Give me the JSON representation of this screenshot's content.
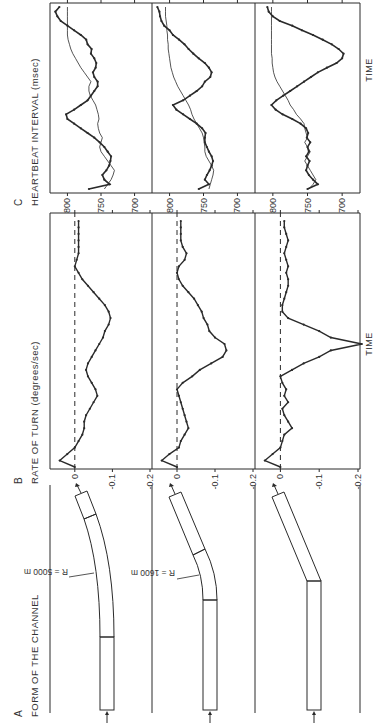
{
  "figure": {
    "orientation": "rotated 90deg counter-clockwise",
    "panels": {
      "A": {
        "letter": "A",
        "title": "FORM OF THE CHANNEL"
      },
      "B": {
        "letter": "B",
        "title": "RATE OF TURN (degrees/sec)"
      },
      "C": {
        "letter": "C",
        "title": "HEARTBEAT INTERVAL (msec)"
      }
    },
    "time_label": "TIME",
    "colors": {
      "ink": "#2a2a2a",
      "background": "#ffffff"
    }
  },
  "channel_forms": [
    {
      "row": 1,
      "label": "R = 5000 m",
      "type": "gentle curve"
    },
    {
      "row": 2,
      "label": "R = 1600 m",
      "type": "sharp curve"
    },
    {
      "row": 3,
      "label": "",
      "type": "abrupt bend"
    }
  ],
  "chart_data": [
    {
      "type": "line",
      "title": "RATE OF TURN (degrees/sec)",
      "xlabel": "TIME",
      "ylabel": "degrees/sec",
      "yticks": [
        "0",
        "-0.1",
        "-0.2"
      ],
      "ylim": [
        0.05,
        -0.2
      ],
      "reference_line": {
        "y": 0,
        "style": "dashed"
      },
      "rows": [
        {
          "row": 1,
          "channel": "R = 5000 m",
          "values": [
            0,
            0.04,
            0.02,
            0,
            -0.01,
            -0.02,
            -0.025,
            -0.025,
            -0.03,
            -0.04,
            -0.05,
            -0.06,
            -0.055,
            -0.045,
            -0.035,
            -0.03,
            -0.035,
            -0.045,
            -0.055,
            -0.065,
            -0.075,
            -0.08,
            -0.09,
            -0.095,
            -0.09,
            -0.08,
            -0.065,
            -0.05,
            -0.035,
            -0.02,
            -0.01,
            0,
            -0.005,
            -0.01,
            -0.01,
            -0.01,
            -0.01,
            -0.01,
            -0.01
          ]
        },
        {
          "row": 2,
          "channel": "R = 1600 m",
          "values": [
            0,
            0.04,
            0.02,
            -0.005,
            -0.01,
            -0.02,
            -0.03,
            -0.025,
            -0.02,
            -0.015,
            -0.01,
            -0.005,
            0,
            -0.015,
            -0.04,
            -0.06,
            -0.09,
            -0.12,
            -0.13,
            -0.125,
            -0.1,
            -0.085,
            -0.08,
            -0.07,
            -0.065,
            -0.055,
            -0.045,
            -0.03,
            -0.015,
            -0.005,
            0,
            -0.005,
            -0.02,
            -0.025,
            -0.015,
            -0.01,
            -0.01,
            -0.01,
            -0.01
          ]
        },
        {
          "row": 3,
          "channel": "abrupt bend",
          "values": [
            0,
            0.04,
            0.02,
            0,
            -0.005,
            -0.01,
            -0.03,
            -0.02,
            -0.01,
            -0.005,
            -0.02,
            -0.01,
            -0.015,
            -0.005,
            0,
            -0.03,
            -0.06,
            -0.1,
            -0.13,
            -0.21,
            -0.13,
            -0.1,
            -0.06,
            -0.02,
            -0.005,
            -0.005,
            -0.01,
            -0.015,
            -0.02,
            -0.02,
            -0.015,
            -0.02,
            -0.015,
            -0.01,
            -0.015,
            -0.02,
            -0.015,
            -0.01,
            -0.01
          ]
        }
      ]
    },
    {
      "type": "line",
      "title": "HEARTBEAT INTERVAL (msec)",
      "xlabel": "TIME",
      "ylabel": "msec",
      "yticks": [
        "800",
        "750",
        "700"
      ],
      "ylim": [
        820,
        680
      ],
      "series_names": [
        "measured (thick, dots)",
        "baseline (thin)"
      ],
      "rows": [
        {
          "row": 1,
          "channel": "R = 5000 m",
          "thick": [
            768,
            737,
            745,
            748,
            742,
            738,
            736,
            735,
            740,
            745,
            752,
            760,
            770,
            780,
            790,
            800,
            802,
            790,
            780,
            770,
            765,
            760,
            755,
            755,
            760,
            762,
            758,
            757,
            760,
            765,
            764,
            770,
            772,
            780,
            790,
            800,
            810,
            815,
            818,
            812
          ],
          "thin": [
            745,
            740,
            735,
            732,
            730,
            735,
            740,
            745,
            750,
            752,
            750,
            748,
            752,
            754,
            755,
            753,
            754,
            756,
            758,
            762,
            766,
            768,
            768,
            765,
            770,
            775,
            780,
            784,
            788,
            792,
            795,
            797,
            799,
            800,
            800,
            800,
            800,
            800,
            800,
            800
          ]
        },
        {
          "row": 2,
          "channel": "R = 1600 m",
          "thick": [
            757,
            742,
            748,
            745,
            741,
            738,
            736,
            738,
            742,
            745,
            748,
            748,
            747,
            752,
            760,
            770,
            780,
            790,
            795,
            780,
            770,
            760,
            752,
            748,
            740,
            738,
            742,
            748,
            757,
            765,
            772,
            778,
            786,
            795,
            800,
            808,
            812,
            814,
            815,
            818
          ],
          "thin": [
            742,
            740,
            738,
            736,
            735,
            738,
            742,
            746,
            748,
            748,
            749,
            750,
            752,
            756,
            760,
            764,
            767,
            769,
            772,
            776,
            780,
            784,
            788,
            791,
            794,
            796,
            798,
            799,
            800,
            801,
            802,
            802,
            803,
            803,
            804,
            804,
            805,
            806,
            806,
            806
          ]
        },
        {
          "row": 3,
          "channel": "abrupt bend",
          "thick": [
            750,
            735,
            742,
            748,
            752,
            750,
            747,
            752,
            748,
            750,
            746,
            751,
            749,
            752,
            760,
            772,
            786,
            796,
            802,
            795,
            785,
            775,
            765,
            755,
            745,
            735,
            722,
            708,
            700,
            698,
            705,
            715,
            728,
            742,
            758,
            772,
            790,
            800,
            806,
            808
          ],
          "thin": [
            748,
            742,
            738,
            742,
            746,
            750,
            754,
            750,
            746,
            750,
            754,
            750,
            752,
            754,
            755,
            760,
            766,
            770,
            775,
            778,
            782,
            786,
            790,
            794,
            797,
            799,
            800,
            801,
            801,
            802,
            802,
            802,
            802,
            802,
            802,
            802,
            802,
            802,
            802,
            802
          ]
        }
      ]
    }
  ]
}
